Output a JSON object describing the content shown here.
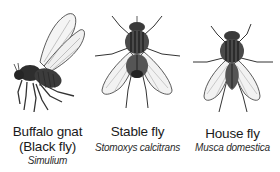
{
  "figure": {
    "flies": [
      {
        "id": "buffalo-gnat",
        "common_name": "Buffalo gnat",
        "common_name_alt": "(Black fly)",
        "scientific_name": "Simulium",
        "view": "side"
      },
      {
        "id": "stable-fly",
        "common_name": "Stable fly",
        "scientific_name": "Stomoxys calcitrans",
        "view": "dorsal"
      },
      {
        "id": "house-fly",
        "common_name": "House fly",
        "scientific_name": "Musca domestica",
        "view": "dorsal"
      }
    ]
  },
  "colors": {
    "background": "#ffffff",
    "ink": "#1a1a1a",
    "body_dark": "#3a3a3a",
    "wing_fill": "#f2f2f2"
  }
}
